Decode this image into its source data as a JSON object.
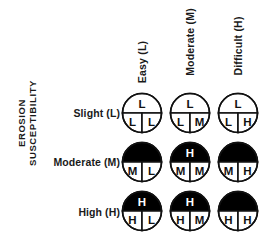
{
  "figure": {
    "y_axis_title_line1": "EROSION",
    "y_axis_title_line2": "SUSCEPTIBILITY"
  },
  "columns": [
    {
      "label": "Easy (L)"
    },
    {
      "label": "Moderate (M)"
    },
    {
      "label": "Difficult (H)"
    }
  ],
  "rows": [
    {
      "label": "Slight (L)"
    },
    {
      "label": "Moderate (M)"
    },
    {
      "label": "High (H)"
    }
  ],
  "colors": {
    "fill_high": "#000000",
    "fill_low": "#ffffff",
    "stroke": "#111111",
    "text_on_white": "#111111",
    "text_on_black": "#ffffff"
  },
  "chart_data": {
    "type": "table",
    "title": "",
    "xlabel": "",
    "ylabel": "EROSION SUSCEPTIBILITY",
    "categories": [
      "Easy (L)",
      "Moderate (M)",
      "Difficult (H)"
    ],
    "row_categories": [
      "Slight (L)",
      "Moderate (M)",
      "High (H)"
    ],
    "legend": [],
    "grid": false,
    "symbol_description": "Circle divided into an upper half and two lower quadrants; black fill denotes the higher (H) rating",
    "cells": [
      {
        "row": "Slight (L)",
        "col": "Easy (L)",
        "top": "L",
        "bottom_left": "L",
        "bottom_right": "L",
        "top_filled": false,
        "bottom_left_filled": false,
        "bottom_right_filled": false,
        "top_visible": true
      },
      {
        "row": "Slight (L)",
        "col": "Moderate (M)",
        "top": "L",
        "bottom_left": "L",
        "bottom_right": "M",
        "top_filled": false,
        "bottom_left_filled": false,
        "bottom_right_filled": false,
        "top_visible": true
      },
      {
        "row": "Slight (L)",
        "col": "Difficult (H)",
        "top": "L",
        "bottom_left": "L",
        "bottom_right": "H",
        "top_filled": false,
        "bottom_left_filled": false,
        "bottom_right_filled": false,
        "top_visible": true
      },
      {
        "row": "Moderate (M)",
        "col": "Easy (L)",
        "top": "",
        "bottom_left": "M",
        "bottom_right": "L",
        "top_filled": true,
        "bottom_left_filled": false,
        "bottom_right_filled": false,
        "top_visible": false
      },
      {
        "row": "Moderate (M)",
        "col": "Moderate (M)",
        "top": "H",
        "bottom_left": "M",
        "bottom_right": "M",
        "top_filled": true,
        "bottom_left_filled": false,
        "bottom_right_filled": false,
        "top_visible": true
      },
      {
        "row": "Moderate (M)",
        "col": "Difficult (H)",
        "top": "",
        "bottom_left": "M",
        "bottom_right": "H",
        "top_filled": true,
        "bottom_left_filled": false,
        "bottom_right_filled": false,
        "top_visible": false
      },
      {
        "row": "High (H)",
        "col": "Easy (L)",
        "top": "H",
        "bottom_left": "H",
        "bottom_right": "L",
        "top_filled": true,
        "bottom_left_filled": false,
        "bottom_right_filled": false,
        "top_visible": true
      },
      {
        "row": "High (H)",
        "col": "Moderate (M)",
        "top": "H",
        "bottom_left": "H",
        "bottom_right": "M",
        "top_filled": true,
        "bottom_left_filled": false,
        "bottom_right_filled": false,
        "top_visible": true
      },
      {
        "row": "High (H)",
        "col": "Difficult (H)",
        "top": "",
        "bottom_left": "H",
        "bottom_right": "H",
        "top_filled": true,
        "bottom_left_filled": false,
        "bottom_right_filled": false,
        "top_visible": false
      }
    ]
  }
}
